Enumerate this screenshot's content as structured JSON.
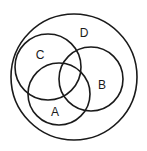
{
  "diagram": {
    "type": "venn",
    "stroke_color": "#1a1a1a",
    "background": "#ffffff",
    "sets": [
      {
        "id": "D",
        "label": "D",
        "cx": 74,
        "cy": 77,
        "r": 63,
        "label_x": 84,
        "label_y": 37,
        "role": "universe"
      },
      {
        "id": "C",
        "label": "C",
        "cx": 48,
        "cy": 67,
        "r": 33,
        "label_x": 40,
        "label_y": 59
      },
      {
        "id": "B",
        "label": "B",
        "cx": 91,
        "cy": 79,
        "r": 32,
        "label_x": 102,
        "label_y": 89
      },
      {
        "id": "A",
        "label": "A",
        "cx": 59,
        "cy": 94,
        "r": 31,
        "label_x": 55,
        "label_y": 116
      }
    ]
  }
}
